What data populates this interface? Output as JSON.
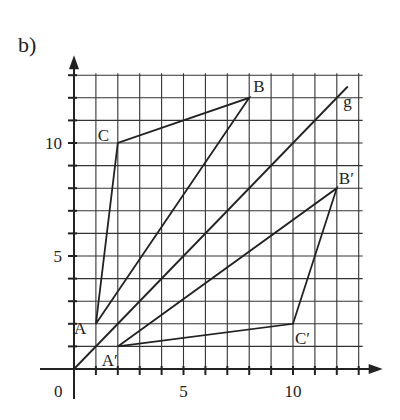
{
  "part_label": "b)",
  "axes": {
    "origin_label": "0",
    "x_tick_labels": [
      {
        "value": 5,
        "label": "5"
      },
      {
        "value": 10,
        "label": "10"
      }
    ],
    "y_tick_labels": [
      {
        "value": 5,
        "label": "5"
      },
      {
        "value": 10,
        "label": "10"
      }
    ],
    "x_max": 13,
    "y_max": 13
  },
  "line_g": {
    "label": "g",
    "from": [
      0,
      0
    ],
    "to": [
      12.5,
      12.5
    ]
  },
  "triangle_original": {
    "points": [
      {
        "name": "A",
        "label": "A",
        "x": 1,
        "y": 2
      },
      {
        "name": "B",
        "label": "B",
        "x": 8,
        "y": 12
      },
      {
        "name": "C",
        "label": "C",
        "x": 2,
        "y": 10
      }
    ]
  },
  "triangle_image": {
    "points": [
      {
        "name": "A'",
        "label": "A′",
        "x": 2,
        "y": 1
      },
      {
        "name": "B'",
        "label": "B′",
        "x": 12,
        "y": 8
      },
      {
        "name": "C'",
        "label": "C′",
        "x": 10,
        "y": 2
      }
    ]
  },
  "colors": {
    "ink": "#222222",
    "grid": "#333333",
    "background": "#ffffff"
  }
}
